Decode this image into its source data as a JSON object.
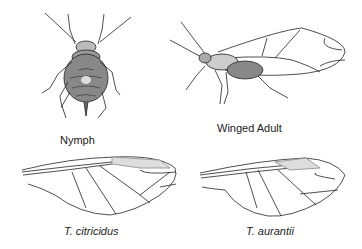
{
  "figure": {
    "panels": [
      {
        "id": "nymph",
        "label": "Nymph"
      },
      {
        "id": "winged-adult",
        "label": "Winged Adult"
      },
      {
        "id": "wing-citricidus",
        "label": "T. citricidus"
      },
      {
        "id": "wing-aurantii",
        "label": "T. aurantii"
      }
    ]
  }
}
